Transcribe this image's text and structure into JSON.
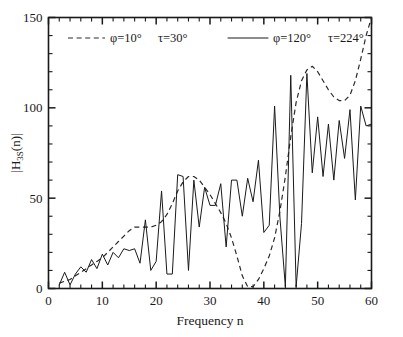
{
  "figure": {
    "background_color": "#ffffff",
    "axis_color": "#1a1a1a",
    "ylabel_main_a": "|H",
    "ylabel_sub": "3S",
    "ylabel_main_b": "(n)|"
  },
  "legend": {
    "entries": [
      {
        "style": "dashed",
        "label": "φ=10°   τ=30°",
        "phi": "φ=10°",
        "tau": "τ=30°"
      },
      {
        "style": "solid",
        "label": "φ=120°   τ=224°",
        "phi": "φ=120°",
        "tau": "τ=224°"
      }
    ]
  },
  "axes": {
    "x_tick_labels": [
      "0",
      "10",
      "20",
      "30",
      "40",
      "50",
      "60"
    ],
    "y_tick_labels": [
      "0",
      "50",
      "100",
      "150"
    ],
    "xlabel": "Frequency  n",
    "ylabel": "|H3S(n)|"
  },
  "chart_data": {
    "type": "line",
    "title": "",
    "subtitle": "",
    "xlabel": "Frequency  n",
    "ylabel": "|H_3S(n)|",
    "xlim": [
      0,
      60
    ],
    "ylim": [
      0,
      150
    ],
    "x_ticks": [
      0,
      10,
      20,
      30,
      40,
      50,
      60
    ],
    "y_ticks": [
      0,
      50,
      100,
      150
    ],
    "x_minor_tick_step": 2,
    "y_minor_tick_step": 10,
    "grid": false,
    "legend_position": "top-inside",
    "annotations": [],
    "series": [
      {
        "name": "φ=10°   τ=30°",
        "style": "dashed",
        "color": "#2a2a2a",
        "x": [
          2,
          3,
          4,
          5,
          6,
          7,
          8,
          9,
          10,
          11,
          12,
          13,
          14,
          15,
          16,
          17,
          18,
          19,
          20,
          21,
          22,
          23,
          24,
          25,
          26,
          27,
          28,
          29,
          30,
          31,
          32,
          33,
          34,
          35,
          36,
          37,
          38,
          39,
          40,
          41,
          42,
          43,
          44,
          45,
          46,
          47,
          48,
          49,
          50,
          51,
          52,
          53,
          54,
          55,
          56,
          57,
          58,
          59,
          60
        ],
        "values": [
          3,
          4,
          5,
          7,
          9,
          11,
          13,
          15,
          17,
          20,
          23,
          26,
          29,
          32,
          34,
          34,
          34,
          34,
          35,
          37,
          41,
          47,
          54,
          59,
          62,
          62,
          60,
          56,
          52,
          47,
          42,
          36,
          28,
          18,
          7,
          1,
          1,
          5,
          11,
          18,
          28,
          43,
          62,
          84,
          103,
          115,
          121,
          123,
          120,
          115,
          110,
          106,
          104,
          104,
          107,
          115,
          127,
          140,
          150
        ]
      },
      {
        "name": "φ=120°   τ=224°",
        "style": "solid",
        "color": "#1a1a1a",
        "x": [
          2,
          3,
          4,
          5,
          6,
          7,
          8,
          9,
          10,
          11,
          12,
          13,
          14,
          15,
          16,
          17,
          18,
          19,
          20,
          21,
          22,
          23,
          24,
          25,
          26,
          27,
          28,
          29,
          30,
          31,
          32,
          33,
          34,
          35,
          36,
          37,
          38,
          39,
          40,
          41,
          42,
          43,
          44,
          45,
          46,
          47,
          48,
          49,
          50,
          51,
          52,
          53,
          54,
          55,
          56,
          57,
          58,
          59,
          60
        ],
        "values": [
          2,
          9,
          2,
          8,
          12,
          9,
          16,
          11,
          19,
          13,
          20,
          17,
          22,
          21,
          22,
          14,
          38,
          10,
          15,
          54,
          8,
          8,
          63,
          62,
          10,
          60,
          34,
          56,
          46,
          46,
          58,
          23,
          60,
          60,
          40,
          61,
          48,
          71,
          31,
          35,
          101,
          39,
          1,
          118,
          1,
          36,
          119,
          64,
          95,
          62,
          91,
          60,
          93,
          72,
          99,
          49,
          101,
          90,
          91
        ]
      }
    ]
  }
}
